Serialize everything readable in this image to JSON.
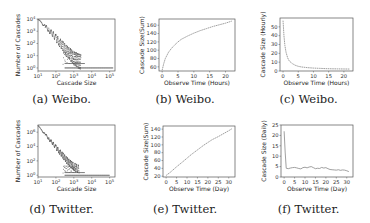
{
  "captions": [
    "(a) Weibo.",
    "(b) Weibo.",
    "(c) Weibo.",
    "(d) Twitter.",
    "(e) Twitter.",
    "(f) Twitter."
  ],
  "colors": {
    "frame": "#555555",
    "line": "#888888",
    "scatter": "#5a5a5a"
  },
  "chart_data": [
    {
      "id": "a",
      "type": "scatter",
      "dataset": "Weibo",
      "title": "",
      "xlabel": "Cascade Size",
      "ylabel": "Number of Cascades",
      "xscale": "log",
      "yscale": "log",
      "xticks": [
        "10^1",
        "10^2",
        "10^3",
        "10^4",
        "10^5"
      ],
      "yticks": [
        "10^0",
        "10^1",
        "10^2",
        "10^3",
        "10^4"
      ],
      "xlim_log10": [
        1,
        5.3
      ],
      "ylim_log10": [
        0,
        4
      ],
      "description": "Power-law distribution: count decreases roughly linearly in log-log from ~10^4 at size 10^1 to ~10^0.5 near size 10^3; a flat band of single-count cascades extends from ~10^2.5 to ~10^5.2",
      "points_log10": [
        [
          1.0,
          3.95
        ],
        [
          1.2,
          3.7
        ],
        [
          1.4,
          3.4
        ],
        [
          1.6,
          3.1
        ],
        [
          1.8,
          2.8
        ],
        [
          2.0,
          2.45
        ],
        [
          2.2,
          2.1
        ],
        [
          2.4,
          1.75
        ],
        [
          2.6,
          1.4
        ],
        [
          2.8,
          1.1
        ],
        [
          3.0,
          0.8
        ],
        [
          3.2,
          0.6
        ],
        [
          3.4,
          0.48
        ]
      ],
      "floor_band_log10": {
        "x": [
          2.5,
          5.2
        ],
        "y": 0
      }
    },
    {
      "id": "b",
      "type": "line",
      "dataset": "Weibo",
      "title": "",
      "xlabel": "Observe Time (Hours)",
      "ylabel": "Cascade Size(Sum)",
      "xticks": [
        0,
        5,
        10,
        15,
        20
      ],
      "yticks": [
        60,
        80,
        100,
        120,
        140,
        160
      ],
      "xlim": [
        -1,
        23
      ],
      "ylim": [
        50,
        175
      ],
      "x": [
        0,
        0.5,
        1,
        2,
        3,
        4,
        5,
        6,
        8,
        10,
        12,
        14,
        16,
        18,
        20,
        22
      ],
      "y": [
        52,
        68,
        80,
        95,
        105,
        113,
        120,
        126,
        134,
        141,
        147,
        152,
        157,
        161,
        165,
        170
      ]
    },
    {
      "id": "c",
      "type": "line",
      "dataset": "Weibo",
      "title": "",
      "xlabel": "Observe Time (Hours)",
      "ylabel": "Cascade Size (Hourly)",
      "xticks": [
        0,
        5,
        10,
        15,
        20
      ],
      "yticks": [
        0,
        10,
        20,
        30,
        40,
        50
      ],
      "xlim": [
        -1,
        23
      ],
      "ylim": [
        0,
        60
      ],
      "x": [
        0,
        0.3,
        0.6,
        1,
        1.5,
        2,
        3,
        4,
        5,
        6,
        8,
        10,
        12,
        14,
        16,
        18,
        20,
        22
      ],
      "y": [
        57,
        40,
        29,
        21,
        15,
        11.5,
        8.5,
        6.5,
        5.3,
        4.6,
        3.8,
        3.3,
        3.0,
        2.7,
        2.5,
        2.4,
        2.3,
        2.2
      ]
    },
    {
      "id": "d",
      "type": "scatter",
      "dataset": "Twitter",
      "title": "",
      "xlabel": "Cascade Size",
      "ylabel": "Number of Cascades",
      "xscale": "log",
      "yscale": "log",
      "xticks": [
        "10^1",
        "10^2",
        "10^3",
        "10^4",
        "10^5"
      ],
      "yticks": [
        "10^0",
        "10^2",
        "10^4",
        "10^6"
      ],
      "xlim_log10": [
        1,
        5.3
      ],
      "ylim_log10": [
        0,
        7
      ],
      "description": "Power-law distribution: count decreases from ~10^7 at size 10^1 to ~10^1 near size 10^3; a flat band of single-count cascades extends from ~10^2.5 to ~10^5",
      "points_log10": [
        [
          1.0,
          6.9
        ],
        [
          1.2,
          6.3
        ],
        [
          1.4,
          5.7
        ],
        [
          1.6,
          5.1
        ],
        [
          1.8,
          4.5
        ],
        [
          2.0,
          3.9
        ],
        [
          2.2,
          3.3
        ],
        [
          2.4,
          2.7
        ],
        [
          2.6,
          2.1
        ],
        [
          2.8,
          1.6
        ],
        [
          3.0,
          1.2
        ],
        [
          3.3,
          0.8
        ]
      ],
      "floor_band_log10": {
        "x": [
          2.5,
          5.0
        ],
        "y": 0
      }
    },
    {
      "id": "e",
      "type": "line",
      "dataset": "Twitter",
      "title": "",
      "xlabel": "Observe Time (Day)",
      "ylabel": "Cascade Size(Sum)",
      "xticks": [
        0,
        5,
        10,
        15,
        20,
        25,
        30
      ],
      "yticks": [
        20,
        40,
        60,
        80,
        100,
        120,
        140
      ],
      "xlim": [
        -1.5,
        33
      ],
      "ylim": [
        18,
        148
      ],
      "x": [
        0,
        2,
        5,
        8,
        10,
        12,
        15,
        18,
        20,
        22,
        25,
        28,
        30,
        31.5
      ],
      "y": [
        22,
        30,
        44,
        57,
        66,
        75,
        87,
        99,
        106,
        113,
        121,
        130,
        136,
        141
      ]
    },
    {
      "id": "f",
      "type": "line",
      "dataset": "Twitter",
      "title": "",
      "xlabel": "Observe Time (Day)",
      "ylabel": "Cascade Size (Daily)",
      "xticks": [
        0,
        5,
        10,
        15,
        20,
        25,
        30
      ],
      "yticks": [
        0,
        5,
        10,
        15,
        20,
        25
      ],
      "xlim": [
        -1.5,
        33
      ],
      "ylim": [
        0,
        25
      ],
      "x": [
        0,
        0.5,
        1,
        2,
        3,
        4,
        5,
        6,
        7,
        8,
        9,
        10,
        11,
        12,
        13,
        14,
        15,
        16,
        17,
        18,
        19,
        20,
        21,
        22,
        23,
        24,
        25,
        26,
        27,
        28,
        29,
        30,
        31
      ],
      "y": [
        22,
        12,
        4.2,
        4.0,
        4.3,
        4.5,
        4.6,
        4.4,
        4.1,
        3.9,
        4.5,
        4.7,
        4.4,
        4.8,
        5.0,
        4.5,
        4.0,
        4.2,
        4.1,
        4.6,
        4.3,
        4.5,
        4.0,
        3.6,
        3.5,
        3.4,
        3.3,
        3.5,
        3.2,
        3.4,
        3.3,
        3.0,
        2.6
      ]
    }
  ]
}
